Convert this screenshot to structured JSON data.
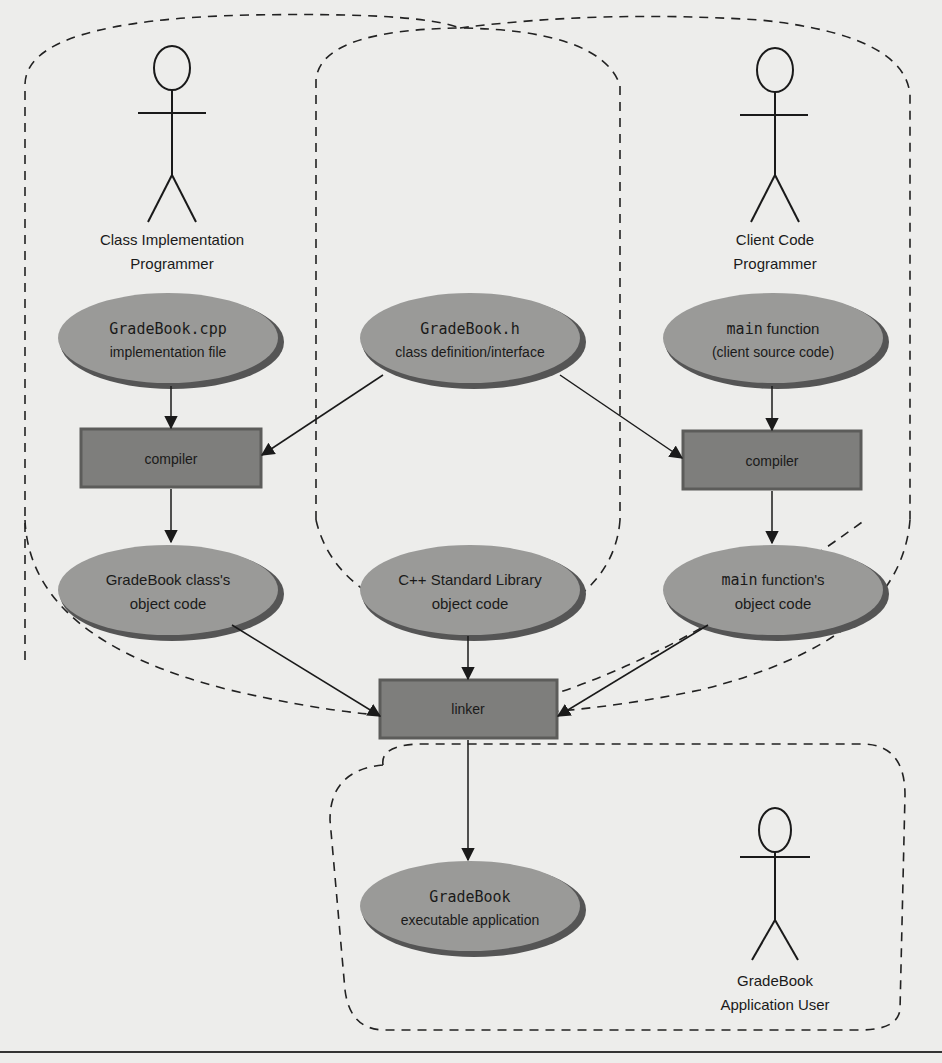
{
  "diagram": {
    "actors": {
      "class_impl": {
        "line1": "Class Implementation",
        "line2": "Programmer"
      },
      "client": {
        "line1": "Client Code",
        "line2": "Programmer"
      },
      "user": {
        "line1": "GradeBook",
        "line2": "Application User"
      }
    },
    "nodes": {
      "gradebook_cpp": {
        "code": "GradeBook.cpp",
        "desc": "implementation file"
      },
      "gradebook_h": {
        "code": "GradeBook.h",
        "desc": "class definition/interface"
      },
      "main_src": {
        "code": "main",
        "code_suffix": " function",
        "desc": "(client source code)"
      },
      "compiler_left": {
        "label": "compiler"
      },
      "compiler_right": {
        "label": "compiler"
      },
      "gradebook_obj": {
        "line1": "GradeBook class's",
        "line2": "object code"
      },
      "stdlib_obj": {
        "line1": "C++ Standard Library",
        "line2": "object code"
      },
      "main_obj": {
        "code": "main",
        "code_suffix": " function's",
        "line2": "object code"
      },
      "linker": {
        "label": "linker"
      },
      "executable": {
        "line1": "GradeBook",
        "line2": "executable application"
      }
    },
    "colors": {
      "ellipse_fill": "#9a9a98",
      "ellipse_shadow": "#555555",
      "box_fill": "#7e7e7c",
      "box_edge": "#5c5c5a",
      "line": "#1a1a1a",
      "page": "#ededeb"
    }
  }
}
